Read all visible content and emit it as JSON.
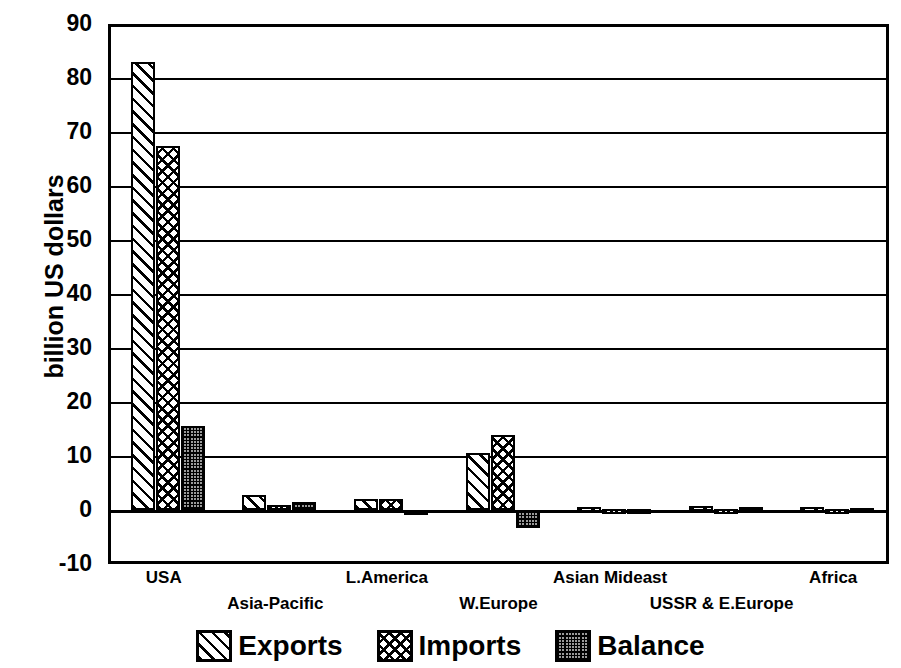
{
  "chart_data": {
    "type": "bar",
    "title": "",
    "subtitle": "",
    "xlabel": "",
    "ylabel": "billion US dollars",
    "ylim": [
      -10,
      90
    ],
    "ytick_step": 10,
    "yticks": [
      "90",
      "80",
      "70",
      "60",
      "50",
      "40",
      "30",
      "20",
      "10",
      "0",
      "-10"
    ],
    "grid": true,
    "legend_position": "bottom",
    "categories": [
      "USA",
      "Asia-Pacific",
      "L.America",
      "W.Europe",
      "Asian Mideast",
      "USSR & E.Europe",
      "Africa"
    ],
    "series": [
      {
        "name": "Exports",
        "pattern": "diagonal-hatch",
        "values": [
          83.0,
          2.7,
          2.1,
          10.5,
          0.5,
          0.8,
          0.6
        ]
      },
      {
        "name": "Imports",
        "pattern": "crosshatch",
        "values": [
          67.4,
          0.9,
          2.0,
          13.8,
          0.2,
          0.1,
          0.2
        ]
      },
      {
        "name": "Balance",
        "pattern": "dot-screen",
        "values": [
          15.6,
          1.5,
          -0.2,
          -3.3,
          0.2,
          0.5,
          0.3
        ]
      }
    ]
  },
  "axis": {
    "y_title": "billion US dollars"
  },
  "legend": {
    "items": [
      {
        "label": "Exports",
        "swatch": "diagonal-hatch-swatch"
      },
      {
        "label": "Imports",
        "swatch": "crosshatch-swatch"
      },
      {
        "label": "Balance",
        "swatch": "dot-screen-swatch"
      }
    ]
  },
  "colors": {
    "ink": "#000000",
    "paper": "#ffffff",
    "balance_fill": "#9a9a9a"
  }
}
